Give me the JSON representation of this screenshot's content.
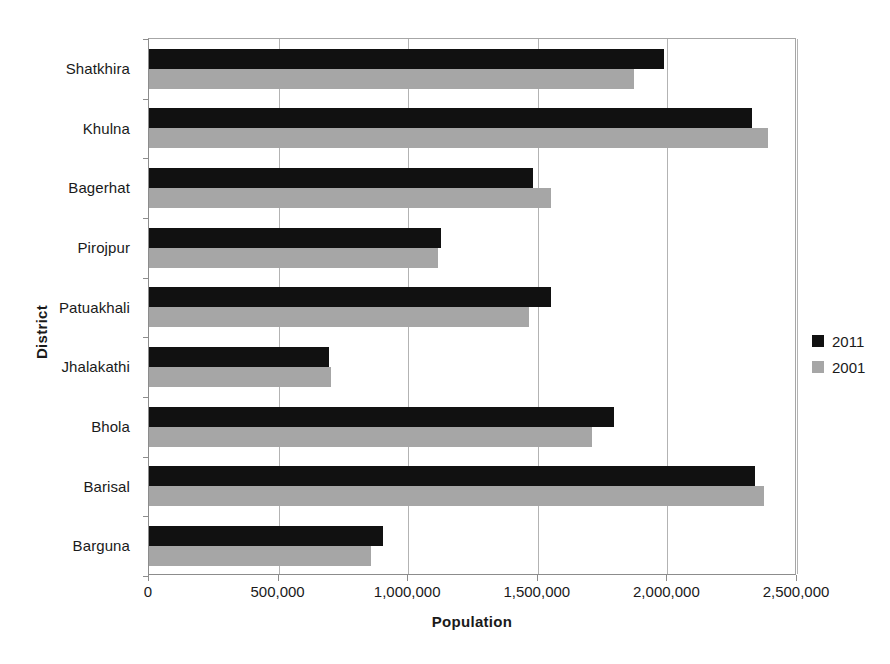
{
  "chart_data": {
    "type": "bar",
    "orientation": "horizontal",
    "title": "",
    "xlabel": "Population",
    "ylabel": "District",
    "xlim": [
      0,
      2500000
    ],
    "xticks": [
      0,
      500000,
      1000000,
      1500000,
      2000000,
      2500000
    ],
    "xtick_labels": [
      "0",
      "500,000",
      "1,000,000",
      "1,500,000",
      "2,000,000",
      "2,500,000"
    ],
    "grid": "vertical",
    "legend_position": "right",
    "categories": [
      "Barguna",
      "Barisal",
      "Bhola",
      "Jhalakathi",
      "Patuakhali",
      "Pirojpur",
      "Bagerhat",
      "Khulna",
      "Shatkhira"
    ],
    "series": [
      {
        "name": "2011",
        "color": "#111111",
        "values": [
          903000,
          2338000,
          1795000,
          695000,
          1549000,
          1126000,
          1480000,
          2325000,
          1986000
        ]
      },
      {
        "name": "2001",
        "color": "#a6a6a6",
        "values": [
          858000,
          2371000,
          1709000,
          702000,
          1465000,
          1115000,
          1551000,
          2387000,
          1870000
        ]
      }
    ]
  },
  "legend": {
    "items": [
      {
        "label": "2011",
        "color": "#111111"
      },
      {
        "label": "2001",
        "color": "#a6a6a6"
      }
    ]
  },
  "axes": {
    "x_title": "Population",
    "y_title": "District"
  }
}
